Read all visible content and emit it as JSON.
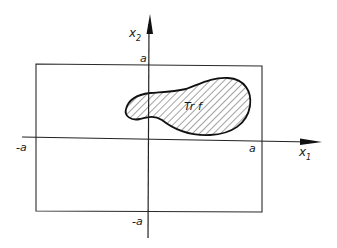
{
  "diagram": {
    "type": "support-region-in-square",
    "axes": {
      "x_label": "x",
      "x_subscript": "1",
      "y_label": "x",
      "y_subscript": "2"
    },
    "ticks": {
      "x_neg": "-a",
      "x_pos": "a",
      "y_pos": "a",
      "y_neg": "-a"
    },
    "region": {
      "label": "Tr f",
      "fill": "hatched"
    },
    "colors": {
      "line": "#1a1a1a",
      "background": "#ffffff"
    }
  }
}
